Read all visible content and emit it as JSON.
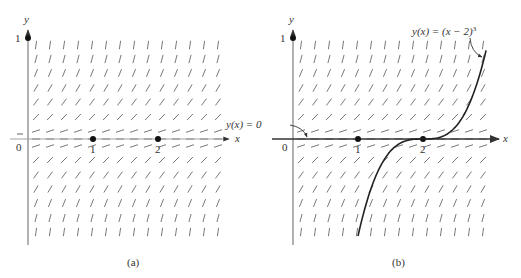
{
  "figure": {
    "panels": [
      {
        "id": "a",
        "caption": "(a)",
        "y_axis_label": "y",
        "x_axis_label": "x",
        "y_tick_label": "1",
        "origin_label": "0",
        "x_tick_labels": [
          "1",
          "2"
        ],
        "equilibrium_points": [
          1,
          2
        ],
        "curves": []
      },
      {
        "id": "b",
        "caption": "(b)",
        "y_axis_label": "y",
        "x_axis_label": "x",
        "y_tick_label": "1",
        "origin_label": "0",
        "x_tick_labels": [
          "1",
          "2"
        ],
        "equilibrium_points": [
          1,
          2
        ],
        "annotations": {
          "zero_solution": "y(x) = 0",
          "cubic_solution": "y(x) = (x − 2)",
          "cubic_exponent": "3"
        }
      }
    ],
    "colors": {
      "axis": "#888888",
      "slope": "#555555",
      "curve": "#222222",
      "point": "#111111"
    }
  }
}
